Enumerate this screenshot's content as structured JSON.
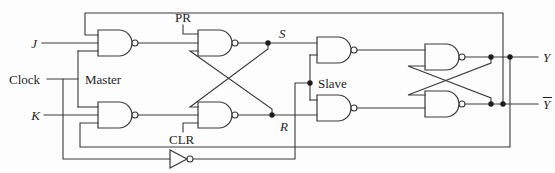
{
  "diagram": {
    "kind": "logic-circuit-schematic",
    "components": {
      "nand_gates": 8,
      "inverters": 1,
      "junction_dots": 7
    },
    "sections": [
      "Master",
      "Slave"
    ]
  },
  "labels": {
    "j": "J",
    "clock": "Clock",
    "k": "K",
    "master": "Master",
    "slave": "Slave",
    "preset": "PR",
    "clear": "CLR",
    "s": "S",
    "r": "R",
    "y": "Y",
    "y_bar_base": "Y",
    "y_bar": "Ȳ"
  },
  "colors": {
    "background": "#fdfdfd",
    "line": "#3a3a3a",
    "text": "#1f1f1f"
  }
}
